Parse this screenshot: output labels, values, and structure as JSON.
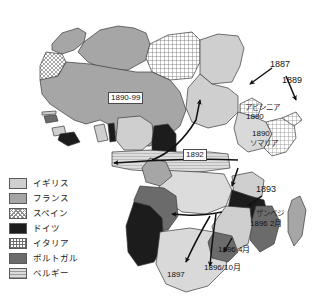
{
  "map": {
    "title_semantic": "africa-colonial-partition-map",
    "continent": "Africa",
    "colors": {
      "uk": "#cfcfcf",
      "france": "#a6a6a6",
      "spain_hatch": "#8f8f8f",
      "germany": "#1c1c1c",
      "italy_grid": "#6e6e6e",
      "portugal": "#6b6b6b",
      "belgium": "#dcdcdc",
      "outline": "#3a3a3a",
      "background": "#ffffff"
    }
  },
  "legend": {
    "items": [
      {
        "label": "イギリス",
        "key": "uk",
        "swatch": "solid-light-gray"
      },
      {
        "label": "フランス",
        "key": "france",
        "swatch": "solid-medium-gray"
      },
      {
        "label": "スペイン",
        "key": "spain",
        "swatch": "diagonal-crosshatch"
      },
      {
        "label": "ドイツ",
        "key": "germany",
        "swatch": "solid-black"
      },
      {
        "label": "イタリア",
        "key": "italy",
        "swatch": "grid-hatch"
      },
      {
        "label": "ポルトガル",
        "key": "portugal",
        "swatch": "solid-dark-gray"
      },
      {
        "label": "ベルギー",
        "key": "belgium",
        "swatch": "horizontal-lines"
      }
    ]
  },
  "annotations": {
    "west_sahel_date": "1890-99",
    "sudan_chad_date": "1892",
    "eritrea_date": "1887",
    "somaliland_date": "1889",
    "abyssinia_name": "アビシニア",
    "abyssinia_date": "1890",
    "somalia_name": "ソマリア",
    "somalia_date": "1890",
    "rhodesia_date": "1893",
    "zambezi_name": "ザンベジ",
    "zambezi_date": "1896 2月",
    "transvaal_date": "1896 4月",
    "natal_date": "1896/10月",
    "bechuana_date": "1897"
  }
}
